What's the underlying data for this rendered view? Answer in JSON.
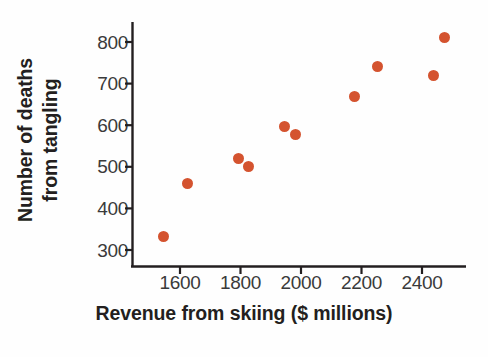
{
  "chart_data": {
    "type": "scatter",
    "title": "",
    "xlabel": "Revenue from skiing ($ millions)",
    "ylabel_line1": "Number of deaths",
    "ylabel_line2": "from tangling",
    "xlim": [
      1480,
      2540
    ],
    "ylim": [
      258,
      830
    ],
    "xticks": [
      1600,
      1800,
      2000,
      2200,
      2400
    ],
    "xtick_labels": [
      "1600",
      "1800",
      "2000",
      "2200",
      "2400"
    ],
    "yticks": [
      300,
      400,
      500,
      600,
      700,
      800
    ],
    "ytick_labels": [
      "300",
      "400",
      "500",
      "600",
      "700",
      "800"
    ],
    "grid": false,
    "legend": null,
    "marker_color": "#d4532f",
    "axis_color": "#231f20",
    "points": [
      {
        "x": 1544,
        "y": 333
      },
      {
        "x": 1626,
        "y": 461
      },
      {
        "x": 1795,
        "y": 519
      },
      {
        "x": 1825,
        "y": 500
      },
      {
        "x": 1947,
        "y": 598
      },
      {
        "x": 1983,
        "y": 577
      },
      {
        "x": 2178,
        "y": 668
      },
      {
        "x": 2254,
        "y": 742
      },
      {
        "x": 2439,
        "y": 720
      },
      {
        "x": 2476,
        "y": 812
      }
    ],
    "series": [
      {
        "name": "Deaths vs revenue",
        "x": [
          1544,
          1626,
          1795,
          1825,
          1947,
          1983,
          2178,
          2254,
          2439,
          2476
        ],
        "values": [
          333,
          461,
          519,
          500,
          598,
          577,
          668,
          742,
          720,
          812
        ]
      }
    ]
  }
}
